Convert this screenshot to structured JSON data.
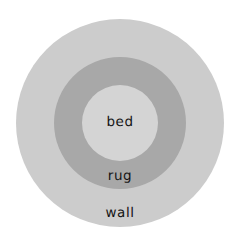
{
  "diagram": {
    "type": "nested-concentric-circles",
    "background_color": "#ffffff",
    "regions": [
      {
        "id": "wall",
        "label": "wall",
        "role": "outer",
        "fill_color": "#cccccc",
        "center_x": 120,
        "center_y": 123,
        "radius": 104,
        "label_x": 120,
        "label_y": 214
      },
      {
        "id": "rug",
        "label": "rug",
        "role": "middle",
        "fill_color": "#a8a8a8",
        "center_x": 120,
        "center_y": 123,
        "radius": 66,
        "label_x": 120,
        "label_y": 177
      },
      {
        "id": "bed",
        "label": "bed",
        "role": "inner",
        "fill_color": "#d4d4d4",
        "center_x": 120,
        "center_y": 123,
        "radius": 38,
        "label_x": 120,
        "label_y": 123
      }
    ],
    "label_color": "#141414"
  }
}
